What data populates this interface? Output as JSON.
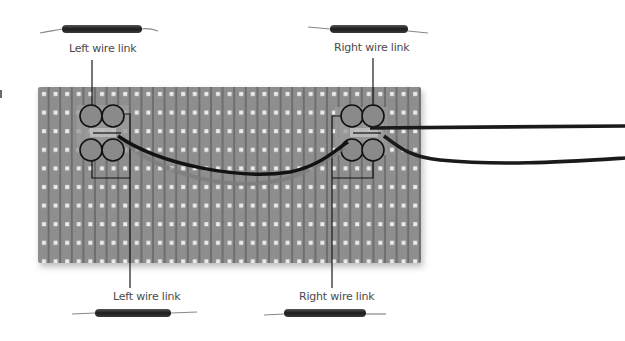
{
  "diagram": {
    "colors": {
      "background": "#ffffff",
      "board": "#8c8c8c",
      "board_strip": "#7a7a7a",
      "hole": "#e6e6e6",
      "wire": "#1a1a1a",
      "callout_line": "#1a1a1a",
      "label_text": "#4a4a4a"
    },
    "labels": {
      "top_left": "Left wire link",
      "top_right": "Right wire link",
      "bottom_left": "Left wire link",
      "bottom_right": "Right wire link"
    },
    "board": {
      "columns": 33,
      "rows": 9
    }
  }
}
